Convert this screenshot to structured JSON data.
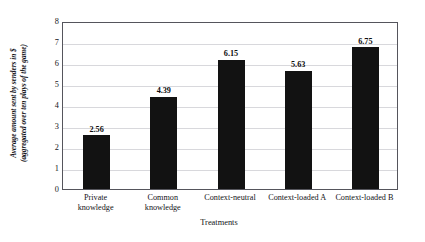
{
  "chart_data": {
    "type": "bar",
    "title": "",
    "subtitle": "",
    "xlabel": "Treatments",
    "ylabel": "Average amount sent by senders in $ (aggregated over ten plays of the game)",
    "ylabel_line1": "Average amount sent by senders in $",
    "ylabel_line2": "(aggregated over ten plays of the game)",
    "categories": [
      "Private knowledge",
      "Common knowledge",
      "Context-neutral",
      "Context-loaded A",
      "Context-loaded B"
    ],
    "categories_wrapped": [
      [
        "Private",
        "knowledge"
      ],
      [
        "Common",
        "knowledge"
      ],
      [
        "Context-neutral"
      ],
      [
        "Context-loaded A"
      ],
      [
        "Context-loaded B"
      ]
    ],
    "values": [
      2.56,
      4.39,
      6.15,
      5.63,
      6.75
    ],
    "value_labels": [
      "2.56",
      "4.39",
      "6.15",
      "5.63",
      "6.75"
    ],
    "ylim": [
      0,
      8
    ],
    "yticks": [
      0,
      1,
      2,
      3,
      4,
      5,
      6,
      7,
      8
    ],
    "ytick_labels": [
      "0",
      "1",
      "2",
      "3",
      "4",
      "5",
      "6",
      "7",
      "8"
    ],
    "xlim_categories": 5,
    "grid": true,
    "grid_axis": "y",
    "legend": false,
    "legend_position": "none",
    "bar_color": "#121212",
    "grid_color": "#d8d8dc",
    "frame_color": "#55555c",
    "background_color": "#ffffff"
  }
}
